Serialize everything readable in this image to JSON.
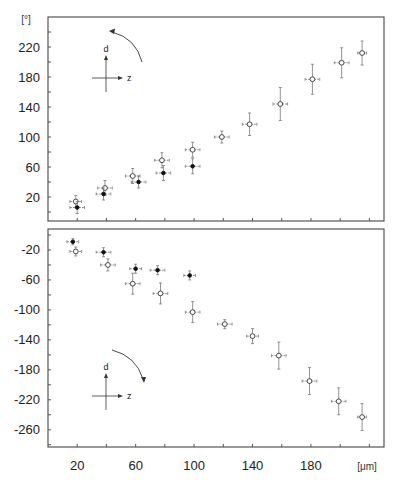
{
  "chart_data": [
    {
      "type": "scatter",
      "panel": "top",
      "title": "",
      "xlabel": "[μm]",
      "ylabel": "[°]",
      "ylim": [
        -12,
        260
      ],
      "xlim": [
        0,
        230
      ],
      "grid": false,
      "y_ticks": [
        20,
        60,
        100,
        140,
        180,
        220
      ],
      "x_ticks": [
        20,
        60,
        100,
        140,
        180
      ],
      "inset": {
        "axis_up": "d",
        "axis_right": "z",
        "rotation": "counterclockwise"
      },
      "series": [
        {
          "name": "open circles",
          "marker": "open-circle",
          "x": [
            19,
            39,
            58,
            78,
            99,
            119,
            138,
            159,
            181,
            201,
            215
          ],
          "y": [
            14,
            32,
            48,
            69,
            83,
            100,
            117,
            144,
            177,
            199,
            212
          ],
          "x_err": [
            4,
            5,
            5,
            5,
            5,
            5,
            5,
            5,
            5,
            5,
            3
          ],
          "y_err": [
            8,
            10,
            10,
            10,
            10,
            8,
            15,
            22,
            20,
            20,
            16
          ]
        },
        {
          "name": "filled circles",
          "marker": "filled-circle",
          "x": [
            20,
            38,
            62,
            79,
            99
          ],
          "y": [
            6,
            24,
            40,
            52,
            61
          ],
          "x_err": [
            5,
            5,
            5,
            5,
            5
          ],
          "y_err": [
            8,
            8,
            8,
            10,
            10
          ]
        }
      ]
    },
    {
      "type": "scatter",
      "panel": "bottom",
      "title": "",
      "xlabel": "[μm]",
      "ylabel": "",
      "ylim": [
        -283,
        8
      ],
      "xlim": [
        0,
        230
      ],
      "grid": false,
      "y_ticks": [
        -20,
        -60,
        -100,
        -140,
        -180,
        -220,
        -260
      ],
      "x_ticks": [
        20,
        60,
        100,
        140,
        180
      ],
      "inset": {
        "axis_up": "d",
        "axis_right": "z",
        "rotation": "clockwise"
      },
      "series": [
        {
          "name": "open circles",
          "marker": "open-circle",
          "x": [
            19,
            41,
            58,
            77,
            99,
            121,
            140,
            158,
            179,
            199,
            215
          ],
          "y": [
            -22,
            -40,
            -65,
            -78,
            -103,
            -119,
            -135,
            -161,
            -195,
            -222,
            -243
          ],
          "x_err": [
            4,
            5,
            5,
            5,
            5,
            5,
            4,
            5,
            5,
            5,
            3
          ],
          "y_err": [
            6,
            8,
            14,
            14,
            14,
            6,
            10,
            18,
            18,
            18,
            18
          ]
        },
        {
          "name": "filled circles",
          "marker": "filled-circle",
          "x": [
            17,
            38,
            60,
            75,
            97
          ],
          "y": [
            -9,
            -23,
            -45,
            -47,
            -54
          ],
          "x_err": [
            4,
            5,
            4,
            5,
            4
          ],
          "y_err": [
            4,
            6,
            6,
            6,
            6
          ]
        }
      ]
    }
  ],
  "labels": {
    "y_unit_top": "[°]",
    "x_unit": "[μm]",
    "inset_d": "d",
    "inset_z": "z"
  },
  "colors": {
    "axis": "#555555",
    "marker": "#333333",
    "errorbar": "#777777"
  }
}
